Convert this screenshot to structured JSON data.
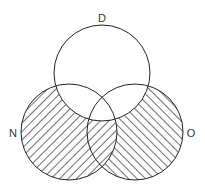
{
  "diagram": {
    "type": "venn-3",
    "sets": [
      {
        "id": "D",
        "label": "D",
        "cx": 102,
        "cy": 73,
        "r": 48,
        "label_x": 102,
        "label_y": 22
      },
      {
        "id": "N",
        "label": "N",
        "cx": 69,
        "cy": 132,
        "r": 48,
        "label_x": 13,
        "label_y": 133
      },
      {
        "id": "O",
        "label": "O",
        "cx": 135,
        "cy": 132,
        "r": 48,
        "label_x": 191,
        "label_y": 133
      }
    ],
    "shaded_regions": [
      {
        "region": "N and not D",
        "pattern": "forward-diagonal hatch"
      },
      {
        "region": "O and not D and not N",
        "pattern": "back-diagonal hatch"
      }
    ],
    "unshaded_regions": [
      "D only",
      "D and N",
      "D and O",
      "D and N and O"
    ],
    "colors": {
      "stroke": "#222222",
      "hatch": "#333333",
      "background": "#ffffff"
    }
  }
}
